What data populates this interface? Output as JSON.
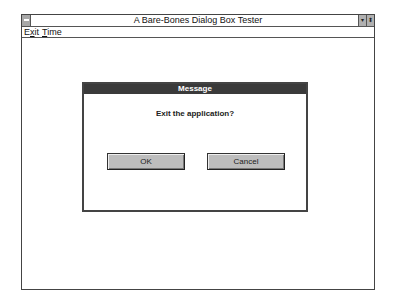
{
  "window": {
    "title": "A Bare-Bones Dialog Box Tester",
    "controls": {
      "minimize": "▾",
      "maximize": "⬍"
    }
  },
  "menubar": {
    "items": [
      {
        "label": "Exit",
        "mnemonic": "x"
      },
      {
        "label": "Time",
        "mnemonic": "T"
      }
    ]
  },
  "dialog": {
    "title": "Message",
    "message": "Exit the application?",
    "buttons": {
      "ok": "OK",
      "cancel": "Cancel"
    }
  }
}
